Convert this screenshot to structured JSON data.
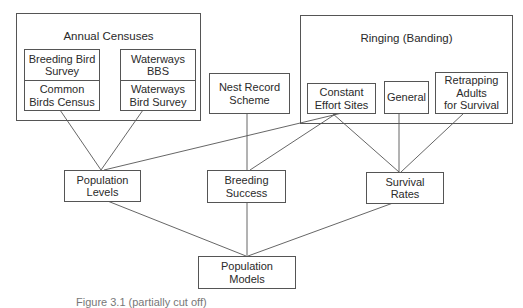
{
  "diagram": {
    "groups": {
      "annual_censuses": {
        "title": "Annual Censuses"
      },
      "ringing": {
        "title": "Ringing (Banding)"
      }
    },
    "sources": {
      "breeding_bird_survey": "Breeding Bird\nSurvey",
      "common_birds_census": "Common\nBirds Census",
      "waterways_bbs": "Waterways\nBBS",
      "waterways_bird_survey": "Waterways\nBird Survey",
      "nest_record_scheme": "Nest Record\nScheme",
      "constant_effort_sites": "Constant\nEffort Sites",
      "general": "General",
      "retrapping_adults": "Retrapping\nAdults\nfor Survival"
    },
    "outputs": {
      "population_levels": "Population\nLevels",
      "breeding_success": "Breeding\nSuccess",
      "survival_rates": "Survival\nRates"
    },
    "final": {
      "population_models": "Population\nModels"
    },
    "edges": [
      [
        "Common Birds Census",
        "Population Levels"
      ],
      [
        "Waterways Bird Survey",
        "Population Levels"
      ],
      [
        "Constant Effort Sites",
        "Population Levels"
      ],
      [
        "Nest Record Scheme",
        "Breeding Success"
      ],
      [
        "Constant Effort Sites",
        "Breeding Success"
      ],
      [
        "Constant Effort Sites",
        "Survival Rates"
      ],
      [
        "General",
        "Survival Rates"
      ],
      [
        "Retrapping Adults for Survival",
        "Survival Rates"
      ],
      [
        "Population Levels",
        "Population Models"
      ],
      [
        "Breeding Success",
        "Population Models"
      ],
      [
        "Survival Rates",
        "Population Models"
      ]
    ]
  },
  "caption": "Figure 3.1 (partially cut off)"
}
